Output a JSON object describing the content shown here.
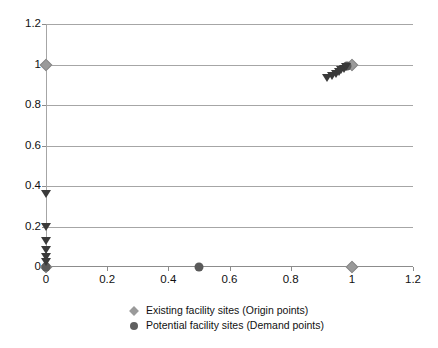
{
  "chart_data": {
    "type": "scatter",
    "title": "",
    "xlabel": "",
    "ylabel": "",
    "xlim": [
      0,
      1.2
    ],
    "ylim": [
      0,
      1.2
    ],
    "xticks": [
      "0",
      "0.2",
      "0.4",
      "0.6",
      "0.8",
      "1",
      "1.2"
    ],
    "yticks": [
      "0",
      "0.2",
      "0.4",
      "0.6",
      "0.8",
      "1",
      "1.2"
    ],
    "xtick_values": [
      0,
      0.2,
      0.4,
      0.6,
      0.8,
      1,
      1.2
    ],
    "ytick_values": [
      0,
      0.2,
      0.4,
      0.6,
      0.8,
      1,
      1.2
    ],
    "grid": "horizontal",
    "legend_position": "bottom",
    "series": [
      {
        "name": "Existing facility sites (Origin points)",
        "marker": "diamond",
        "color": "#9a9a9a",
        "points": [
          {
            "x": 0,
            "y": 1
          },
          {
            "x": 1,
            "y": 0
          },
          {
            "x": 1,
            "y": 1
          },
          {
            "x": 0,
            "y": 0
          }
        ]
      },
      {
        "name": "Potential facility sites (Demand points)",
        "marker": "circle",
        "color": "#5a5a5a",
        "points": [
          {
            "x": 0,
            "y": 0
          },
          {
            "x": 0.5,
            "y": 0
          },
          {
            "x": 0.985,
            "y": 0.995
          }
        ]
      },
      {
        "name": "Unlabeled triangle markers",
        "marker": "triangle-down",
        "color": "#3a3a3a",
        "points": [
          {
            "x": 0,
            "y": 0.36
          },
          {
            "x": 0,
            "y": 0.2
          },
          {
            "x": 0,
            "y": 0.13
          },
          {
            "x": 0,
            "y": 0.085
          },
          {
            "x": 0,
            "y": 0.05
          },
          {
            "x": 0,
            "y": 0.025
          },
          {
            "x": 0.92,
            "y": 0.935
          },
          {
            "x": 0.935,
            "y": 0.945
          },
          {
            "x": 0.948,
            "y": 0.955
          },
          {
            "x": 0.958,
            "y": 0.965
          },
          {
            "x": 0.966,
            "y": 0.972
          },
          {
            "x": 0.974,
            "y": 0.98
          },
          {
            "x": 0.98,
            "y": 0.988
          }
        ]
      }
    ]
  },
  "legend": {
    "items": [
      {
        "label": "Existing facility sites (Origin points)",
        "marker": "diamond",
        "color": "#9a9a9a"
      },
      {
        "label": "Potential facility sites (Demand points)",
        "marker": "circle",
        "color": "#5f5f5f"
      }
    ]
  },
  "colors": {
    "gridline": "#a6a6a6",
    "axis": "#8c8c8c",
    "existing_marker": "#9a9a9a",
    "potential_marker": "#5a5a5a",
    "triangle_marker": "#3a3a3a",
    "background": "#ffffff"
  }
}
